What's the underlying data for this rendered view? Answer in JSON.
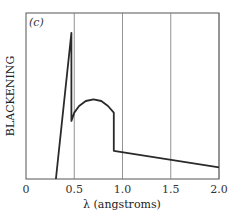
{
  "chart_data": {
    "type": "line",
    "title": "",
    "panel_label": "(c)",
    "xlabel": "λ (angstroms)",
    "ylabel": "BLACKENING",
    "xlim": [
      0,
      2.0
    ],
    "ylim": [
      0,
      1
    ],
    "grid": {
      "vertical_at": [
        0.5,
        1.0,
        1.5,
        2.0
      ],
      "horizontal": false
    },
    "x_ticks": [
      "0",
      "0.5",
      "1.0",
      "1.5",
      "2.0"
    ],
    "y_ticks": [],
    "legend": null,
    "series": [
      {
        "name": "blackening curve",
        "points": [
          [
            0.31,
            0.0
          ],
          [
            0.47,
            0.88
          ],
          [
            0.47,
            0.35
          ],
          [
            0.5,
            0.4
          ],
          [
            0.55,
            0.44
          ],
          [
            0.62,
            0.47
          ],
          [
            0.7,
            0.48
          ],
          [
            0.78,
            0.47
          ],
          [
            0.85,
            0.44
          ],
          [
            0.91,
            0.4
          ],
          [
            0.91,
            0.17
          ],
          [
            2.0,
            0.07
          ]
        ]
      }
    ]
  }
}
